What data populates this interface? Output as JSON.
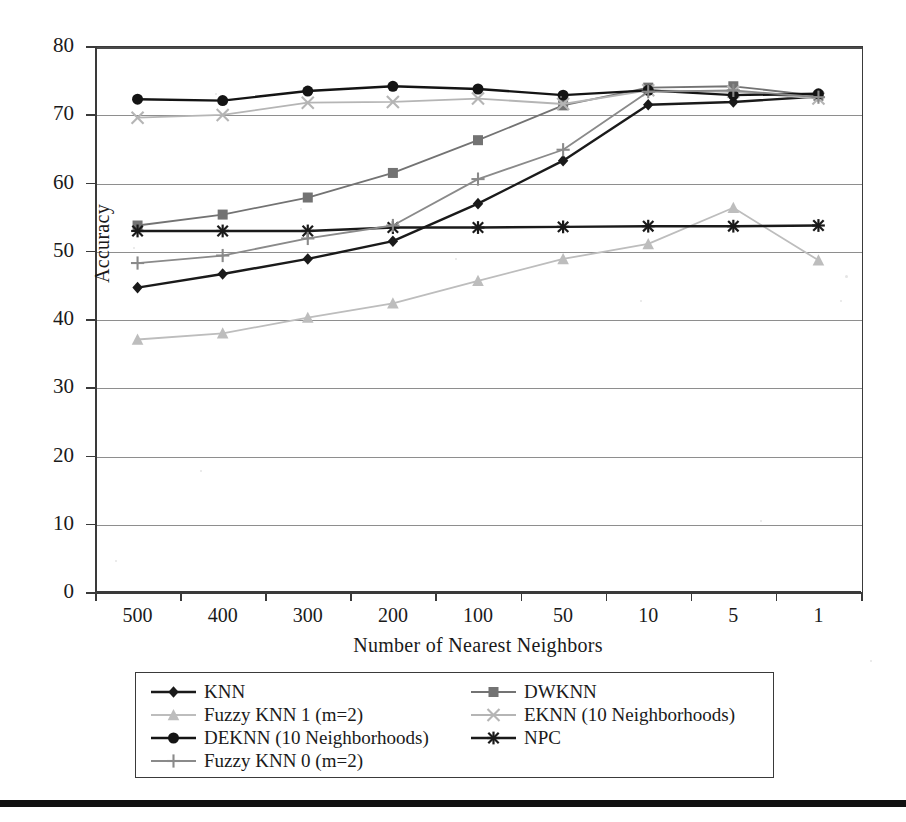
{
  "chart_data": {
    "type": "line",
    "title": "",
    "xlabel": "Number of Nearest Neighbors",
    "ylabel": "Accuracy",
    "categories": [
      "500",
      "400",
      "300",
      "200",
      "100",
      "50",
      "10",
      "5",
      "1"
    ],
    "ylim": [
      0,
      80
    ],
    "ytick_step": 10,
    "yticks": [
      "80",
      "70",
      "60",
      "50",
      "40",
      "30",
      "20",
      "10",
      "0"
    ],
    "grid": "horizontal",
    "legend_position": "below-plot",
    "legend_columns": 2,
    "series": [
      {
        "name": "KNN",
        "marker": "diamond",
        "color": "#1a1a1a",
        "values": [
          44.6,
          46.6,
          48.8,
          51.4,
          56.9,
          63.2,
          71.4,
          71.8,
          72.6
        ]
      },
      {
        "name": "DWKNN",
        "marker": "square",
        "color": "#737373",
        "values": [
          53.7,
          55.3,
          57.8,
          61.4,
          66.2,
          71.3,
          73.9,
          74.1,
          72.7
        ]
      },
      {
        "name": "Fuzzy KNN 1 (m=2)",
        "marker": "triangle",
        "color": "#bdbdbd",
        "values": [
          37.0,
          37.9,
          40.2,
          42.3,
          45.6,
          48.8,
          51.0,
          56.3,
          48.6
        ]
      },
      {
        "name": "EKNN (10 Neighborhoods)",
        "marker": "x",
        "color": "#b5b5b5",
        "values": [
          69.5,
          69.9,
          71.7,
          71.8,
          72.3,
          71.5,
          73.5,
          73.3,
          72.3
        ]
      },
      {
        "name": "DEKNN (10 Neighborhoods)",
        "marker": "circle",
        "color": "#141414",
        "values": [
          72.2,
          72.0,
          73.4,
          74.1,
          73.7,
          72.8,
          73.5,
          72.8,
          73.0
        ]
      },
      {
        "name": "NPC",
        "marker": "asterisk",
        "color": "#1a1a1a",
        "values": [
          52.9,
          52.9,
          52.9,
          53.4,
          53.4,
          53.5,
          53.6,
          53.6,
          53.7
        ]
      },
      {
        "name": "Fuzzy KNN 0 (m=2)",
        "marker": "plus",
        "color": "#8a8a8a",
        "values": [
          48.2,
          49.3,
          51.8,
          53.7,
          60.5,
          64.8,
          73.3,
          73.5,
          72.5
        ]
      }
    ]
  },
  "legend": {
    "entries": [
      {
        "label": "KNN"
      },
      {
        "label": "DWKNN"
      },
      {
        "label": "Fuzzy KNN 1 (m=2)"
      },
      {
        "label": "EKNN (10 Neighborhoods)"
      },
      {
        "label": "DEKNN (10 Neighborhoods)"
      },
      {
        "label": "NPC"
      },
      {
        "label": "Fuzzy KNN 0 (m=2)"
      }
    ]
  }
}
